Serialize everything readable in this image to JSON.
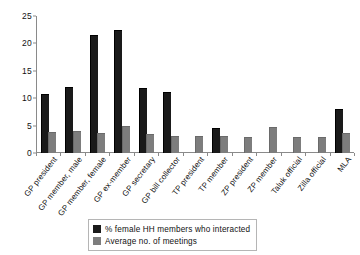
{
  "chart_data": {
    "type": "bar",
    "title": "",
    "subtitle": "",
    "xlabel": "",
    "ylabel": "",
    "ylim": [
      0,
      25
    ],
    "yticks": [
      0,
      5,
      10,
      15,
      20,
      25
    ],
    "ytick_labels": [
      "0",
      "5",
      "10",
      "15",
      "20",
      "25"
    ],
    "grid": false,
    "legend_position": "bottom-center",
    "categories": [
      "GP president",
      "GP member, male",
      "GP member, female",
      "GP ex-member",
      "GP secretary",
      "GP bill collector",
      "TP president",
      "TP member",
      "ZP president",
      "ZP member",
      "Taluk official",
      "Zilla official",
      "MLA"
    ],
    "series": [
      {
        "name": "% female HH members who interacted",
        "color": "#1a1a1a",
        "values": [
          10.6,
          11.8,
          21.4,
          22.3,
          11.6,
          11.0,
          0,
          4.3,
          0,
          0,
          0,
          0,
          7.9
        ]
      },
      {
        "name": "Average no. of meetings",
        "color": "#7d7d7d",
        "values": [
          3.6,
          3.8,
          3.5,
          4.7,
          3.2,
          2.9,
          2.9,
          2.9,
          2.7,
          4.5,
          2.7,
          2.8,
          3.4
        ]
      }
    ]
  },
  "legend": {
    "entries": [
      {
        "label": "% female HH members who interacted",
        "swatch": "black"
      },
      {
        "label": "Average no. of meetings",
        "swatch": "gray"
      }
    ]
  }
}
